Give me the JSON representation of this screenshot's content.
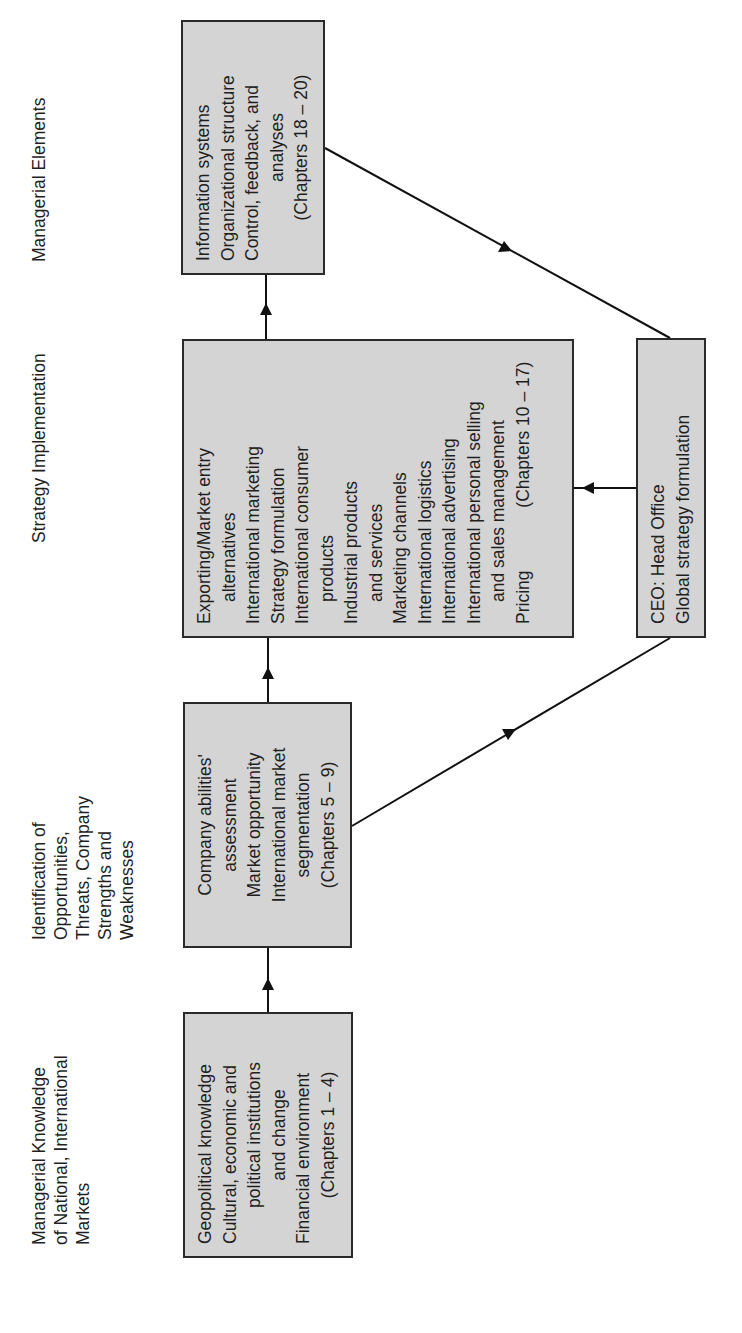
{
  "headers": {
    "col1": [
      "Managerial Knowledge",
      "of National,  International",
      "Markets"
    ],
    "col2": [
      "Identification of",
      "Opportunities,",
      "Threats,  Company",
      "Strengths and",
      "Weaknesses"
    ],
    "col3": [
      "Strategy  Implementation"
    ],
    "col4": [
      "Managerial Elements"
    ]
  },
  "boxes": {
    "geopolitical": {
      "lines": [
        "Geopolitical knowledge",
        "Cultural, economic and",
        "political institutions",
        "and change",
        "Financial environment",
        "(Chapters 1 – 4)"
      ]
    },
    "company": {
      "lines": [
        "Company abilities'",
        "assessment",
        "Market opportunity",
        "International market",
        "segmentation",
        "(Chapters 5 – 9)"
      ]
    },
    "strategy": {
      "lines": [
        "Exporting/Market entry",
        "alternatives",
        "International marketing",
        "Strategy formulation",
        "International consumer",
        "products",
        "Industrial products",
        "and services",
        "Marketing channels",
        "International logistics",
        "International advertising",
        "International personal selling",
        "and sales management",
        "Pricing",
        "(Chapters 10 – 17)"
      ]
    },
    "information": {
      "lines": [
        "Information systems",
        "Organizational structure",
        "Control, feedback, and",
        "analyses",
        "(Chapters 18 – 20)"
      ]
    },
    "ceo": {
      "lines": [
        "CEO:  Head Office",
        "Global strategy formulation"
      ]
    }
  },
  "colors": {
    "box_fill": "#d4d4d4",
    "box_border": "#2a2a2a",
    "line": "#111111",
    "text": "#1f1f1f"
  },
  "connections": [
    {
      "from": "geopolitical",
      "to": "company"
    },
    {
      "from": "company",
      "to": "strategy"
    },
    {
      "from": "strategy",
      "to": "information"
    },
    {
      "from": "information",
      "to": "ceo"
    },
    {
      "from": "ceo",
      "to": "strategy"
    },
    {
      "from": "company",
      "to": "ceo"
    }
  ]
}
